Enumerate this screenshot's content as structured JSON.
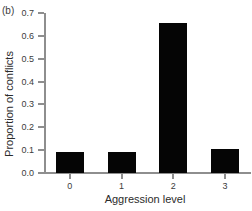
{
  "panel": {
    "label": "(b)"
  },
  "chart_data": {
    "type": "bar",
    "title": "",
    "panel_label": "(b)",
    "xlabel": "Aggression level",
    "ylabel": "Proportion of conflicts",
    "categories": [
      "0",
      "1",
      "2",
      "3"
    ],
    "values": [
      0.09,
      0.09,
      0.655,
      0.105
    ],
    "ylim": [
      0.0,
      0.7
    ],
    "ytick_labels": [
      "0.0",
      "0.1",
      "0.2",
      "0.3",
      "0.4",
      "0.5",
      "0.6",
      "0.7"
    ],
    "ytick_values": [
      0.0,
      0.1,
      0.2,
      0.3,
      0.4,
      0.5,
      0.6,
      0.7
    ],
    "xtick_labels": [
      "0",
      "1",
      "2",
      "3"
    ],
    "grid": false,
    "legend": null,
    "bar_color": "#050505",
    "axis_color": "#8e8e8e",
    "series": [
      {
        "name": "Proportion of conflicts",
        "values": [
          0.09,
          0.09,
          0.655,
          0.105
        ]
      }
    ]
  }
}
